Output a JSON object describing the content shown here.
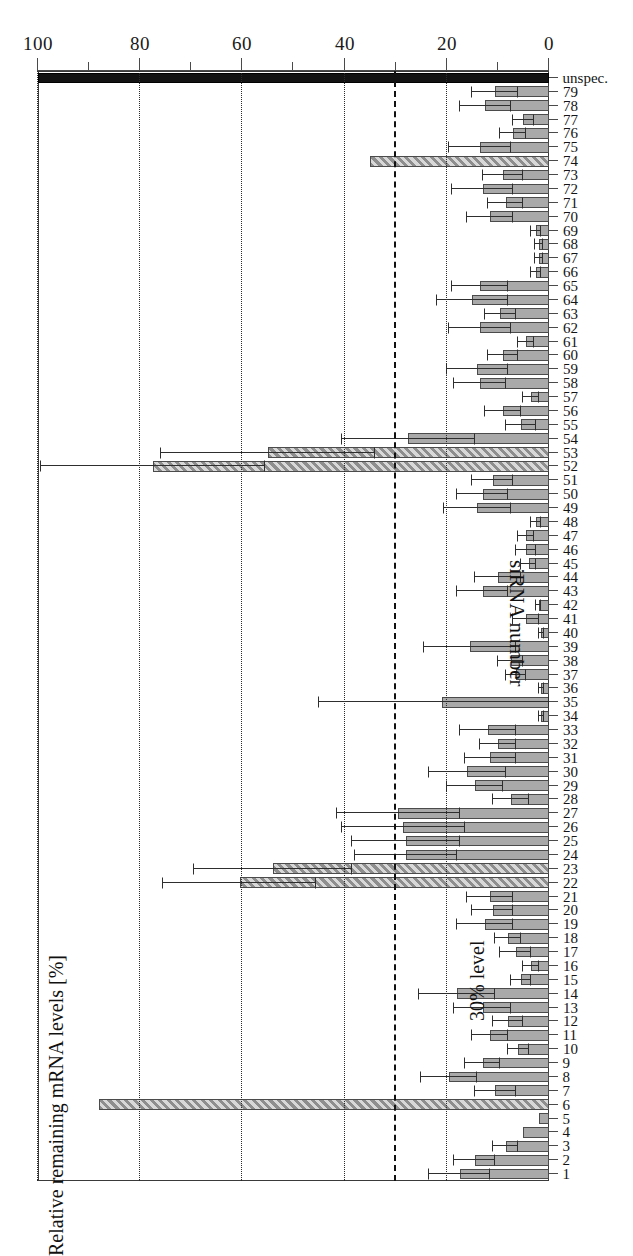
{
  "chart_data": {
    "type": "bar",
    "orientation": "vertical-rotated-180",
    "title": "",
    "xlabel": "siRNA number",
    "ylabel": "Relative remaining mRNA levels [%]",
    "ylim": [
      0,
      100
    ],
    "yticks": [
      0,
      20,
      40,
      60,
      80,
      100
    ],
    "ytick_labels": [
      "0",
      "20",
      "40",
      "60",
      "80",
      "100"
    ],
    "minor_ticks": [
      10,
      30,
      50,
      70,
      90
    ],
    "grid": "dotted vertical gridlines at 20, 40, 60, 80, 100",
    "annotations": [
      {
        "text": "30% level",
        "value": 30,
        "style": "dashed line"
      }
    ],
    "legend": [],
    "series_name": "Relative remaining mRNA levels",
    "error_bars": "standard deviation",
    "categories": [
      "1",
      "2",
      "3",
      "4",
      "5",
      "6",
      "7",
      "8",
      "9",
      "10",
      "11",
      "12",
      "13",
      "14",
      "15",
      "16",
      "17",
      "18",
      "19",
      "20",
      "21",
      "22",
      "23",
      "24",
      "25",
      "26",
      "27",
      "28",
      "29",
      "30",
      "31",
      "32",
      "33",
      "34",
      "35",
      "36",
      "37",
      "38",
      "39",
      "40",
      "41",
      "42",
      "43",
      "44",
      "45",
      "46",
      "47",
      "48",
      "49",
      "50",
      "51",
      "52",
      "53",
      "54",
      "55",
      "56",
      "57",
      "58",
      "59",
      "60",
      "61",
      "62",
      "63",
      "64",
      "65",
      "66",
      "67",
      "68",
      "69",
      "70",
      "71",
      "72",
      "73",
      "74",
      "75",
      "76",
      "77",
      "78",
      "79",
      "unspec."
    ],
    "values": [
      17.5,
      14.5,
      8.5,
      5.0,
      2.0,
      88.0,
      10.5,
      19.5,
      13.0,
      6.0,
      11.5,
      8.0,
      13.0,
      18.0,
      5.5,
      3.5,
      6.5,
      8.0,
      12.5,
      11.0,
      11.5,
      60.5,
      54.0,
      28.0,
      28.0,
      28.5,
      29.5,
      7.5,
      14.5,
      16.0,
      11.5,
      10.0,
      12.0,
      1.5,
      21.0,
      1.5,
      6.5,
      7.5,
      15.5,
      1.5,
      4.5,
      2.0,
      13.0,
      10.0,
      4.0,
      4.5,
      4.5,
      2.5,
      14.0,
      13.0,
      11.0,
      77.5,
      55.0,
      27.5,
      5.5,
      9.0,
      3.5,
      13.5,
      14.0,
      9.0,
      4.5,
      13.5,
      9.5,
      15.0,
      13.5,
      2.5,
      2.0,
      2.0,
      2.5,
      11.5,
      8.5,
      13.0,
      9.0,
      35.0,
      13.5,
      7.0,
      5.0,
      12.5,
      10.5,
      100.0
    ],
    "errors_low": [
      6.0,
      4.0,
      2.5,
      0.0,
      0.0,
      0.0,
      4.0,
      5.5,
      3.5,
      2.0,
      3.5,
      3.0,
      5.5,
      7.5,
      2.0,
      1.5,
      3.0,
      2.5,
      5.5,
      4.0,
      4.5,
      15.0,
      15.5,
      10.0,
      10.5,
      12.0,
      12.0,
      3.5,
      5.5,
      7.5,
      5.0,
      3.5,
      5.5,
      0.5,
      24.0,
      0.5,
      2.0,
      2.5,
      9.0,
      0.5,
      2.5,
      0.5,
      5.0,
      4.5,
      1.5,
      2.0,
      1.5,
      1.0,
      6.5,
      5.0,
      4.0,
      22.0,
      21.0,
      13.0,
      3.0,
      3.5,
      1.5,
      5.0,
      6.0,
      3.0,
      1.5,
      6.0,
      3.0,
      7.0,
      5.5,
      1.0,
      0.8,
      0.8,
      1.0,
      4.5,
      3.5,
      6.0,
      4.0,
      0.0,
      6.0,
      2.5,
      2.0,
      5.0,
      4.5,
      0.0
    ],
    "errors_high": [
      6.0,
      4.0,
      2.5,
      0.0,
      0.0,
      0.0,
      4.0,
      5.5,
      3.5,
      2.0,
      3.5,
      3.0,
      5.5,
      7.5,
      2.0,
      1.5,
      3.0,
      2.5,
      5.5,
      4.0,
      4.5,
      15.0,
      15.5,
      10.0,
      10.5,
      12.0,
      12.0,
      3.5,
      5.5,
      7.5,
      5.0,
      3.5,
      5.5,
      0.5,
      24.0,
      0.5,
      2.0,
      2.5,
      9.0,
      0.5,
      2.5,
      0.5,
      5.0,
      4.5,
      1.5,
      2.0,
      1.5,
      1.0,
      6.5,
      5.0,
      4.0,
      22.0,
      21.0,
      13.0,
      3.0,
      3.5,
      1.5,
      5.0,
      6.0,
      3.0,
      1.5,
      6.0,
      3.0,
      7.0,
      5.5,
      1.0,
      0.8,
      0.8,
      1.0,
      4.5,
      3.5,
      6.0,
      4.0,
      0.0,
      6.0,
      2.5,
      2.0,
      5.0,
      4.5,
      0.0
    ],
    "bar_styles": [
      "plain",
      "plain",
      "plain",
      "plain",
      "plain",
      "hatched",
      "plain",
      "plain",
      "plain",
      "plain",
      "plain",
      "plain",
      "plain",
      "plain",
      "plain",
      "plain",
      "plain",
      "plain",
      "plain",
      "plain",
      "plain",
      "hatched",
      "hatched",
      "plain",
      "plain",
      "plain",
      "plain",
      "plain",
      "plain",
      "plain",
      "plain",
      "plain",
      "plain",
      "plain",
      "plain",
      "plain",
      "plain",
      "plain",
      "plain",
      "plain",
      "plain",
      "plain",
      "plain",
      "plain",
      "plain",
      "plain",
      "plain",
      "plain",
      "plain",
      "plain",
      "plain",
      "hatched",
      "hatched",
      "plain",
      "plain",
      "plain",
      "plain",
      "plain",
      "plain",
      "plain",
      "plain",
      "plain",
      "plain",
      "plain",
      "plain",
      "plain",
      "plain",
      "plain",
      "plain",
      "plain",
      "plain",
      "plain",
      "plain",
      "hatched",
      "plain",
      "plain",
      "plain",
      "plain",
      "plain",
      "black"
    ]
  }
}
